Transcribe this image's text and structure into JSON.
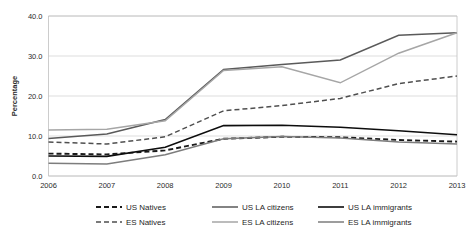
{
  "chart_data": {
    "type": "line",
    "title": "",
    "xlabel": "",
    "ylabel": "Percentage",
    "categories": [
      "2006",
      "2007",
      "2008",
      "2009",
      "2010",
      "2011",
      "2012",
      "2013"
    ],
    "x": [
      2006,
      2007,
      2008,
      2009,
      2010,
      2011,
      2012,
      2013
    ],
    "ylim": [
      0.0,
      40.0
    ],
    "yticks": [
      "0.0",
      "10.0",
      "20.0",
      "30.0",
      "40.0"
    ],
    "ytick_values": [
      0.0,
      10.0,
      20.0,
      30.0,
      40.0
    ],
    "grid": true,
    "legend_position": "bottom",
    "legend_columns": 3,
    "series": [
      {
        "name": "US Natives",
        "values": [
          5.6,
          5.4,
          6.4,
          9.3,
          9.8,
          9.7,
          9.0,
          8.6
        ],
        "color": "#1a1a1a",
        "dash": "5,3",
        "width": 1.9
      },
      {
        "name": "US LA citizens",
        "values": [
          9.4,
          10.5,
          14.1,
          26.6,
          27.9,
          29.0,
          35.2,
          35.8
        ],
        "color": "#5a5a5a",
        "dash": "",
        "width": 1.5
      },
      {
        "name": "US LA immigrants",
        "values": [
          5.0,
          4.9,
          7.2,
          12.6,
          12.7,
          12.2,
          11.3,
          10.3
        ],
        "color": "#0d0d0d",
        "dash": "",
        "width": 1.6
      },
      {
        "name": "ES Natives",
        "values": [
          8.5,
          8.0,
          9.8,
          16.3,
          17.6,
          19.4,
          23.1,
          25.0
        ],
        "color": "#4f4f4f",
        "dash": "5,3",
        "width": 1.5
      },
      {
        "name": "ES LA citizens",
        "values": [
          11.5,
          11.7,
          13.8,
          26.4,
          27.3,
          23.3,
          30.7,
          35.8
        ],
        "color": "#a6a6a6",
        "dash": "",
        "width": 1.5
      },
      {
        "name": "ES LA immigrants",
        "values": [
          3.2,
          3.0,
          5.3,
          9.3,
          9.9,
          9.5,
          8.5,
          8.0
        ],
        "color": "#7d7d7d",
        "dash": "",
        "width": 1.5
      }
    ]
  },
  "legend": {
    "items": [
      {
        "label": "US Natives"
      },
      {
        "label": "US LA citizens"
      },
      {
        "label": "US LA immigrants"
      },
      {
        "label": "ES Natives"
      },
      {
        "label": "ES LA citizens"
      },
      {
        "label": "ES LA immigrants"
      }
    ]
  }
}
